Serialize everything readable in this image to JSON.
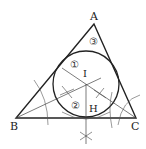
{
  "diagram": {
    "type": "geometry-construction",
    "vertices": {
      "A": {
        "label": "A",
        "x": 94,
        "y": 24
      },
      "B": {
        "label": "B",
        "x": 16,
        "y": 118
      },
      "C": {
        "label": "C",
        "x": 136,
        "y": 118
      }
    },
    "points": {
      "I": {
        "label": "I",
        "x": 86,
        "y": 84
      },
      "H": {
        "label": "H",
        "x": 86,
        "y": 118
      }
    },
    "incircle": {
      "cx": 86,
      "cy": 84,
      "r": 33
    },
    "step_markers": [
      {
        "label": "①",
        "x": 71,
        "y": 65
      },
      {
        "label": "②",
        "x": 73,
        "y": 106
      },
      {
        "label": "③",
        "x": 91,
        "y": 41
      }
    ],
    "colors": {
      "stroke": "#222222",
      "thin": "#444444",
      "background": "#ffffff"
    }
  }
}
